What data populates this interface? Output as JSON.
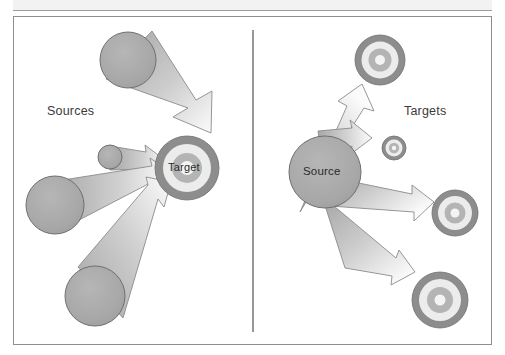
{
  "figure": {
    "title_band": "",
    "divider": {
      "name": "vertical-divider",
      "x": 253,
      "y1": 30,
      "y2": 332
    },
    "left_panel": {
      "caption": "Sources",
      "hub_label": "Target",
      "description": "many-to-one: several source shapes converge with arrows onto a single bullseye target",
      "sources": [
        {
          "id": "source-top-left",
          "cx": 128,
          "cy": 60,
          "r": 28
        },
        {
          "id": "source-mid-small",
          "cx": 110,
          "cy": 157,
          "r": 12
        },
        {
          "id": "source-mid-left",
          "cx": 55,
          "cy": 205,
          "r": 29
        },
        {
          "id": "source-bottom-left",
          "cx": 95,
          "cy": 296,
          "r": 30
        }
      ],
      "hub": {
        "id": "target-hub",
        "cx": 187,
        "cy": 168,
        "r": 32
      }
    },
    "right_panel": {
      "caption": "Targets",
      "hub_label": "Source",
      "description": "one-to-many: a single source circle fans out with arrows to several bullseye targets",
      "hub": {
        "id": "source-hub",
        "cx": 325,
        "cy": 172,
        "r": 36
      },
      "targets": [
        {
          "id": "target-top-right",
          "cx": 380,
          "cy": 60,
          "r": 25
        },
        {
          "id": "target-small-right",
          "cx": 394,
          "cy": 148,
          "r": 12
        },
        {
          "id": "target-mid-right",
          "cx": 455,
          "cy": 213,
          "r": 23
        },
        {
          "id": "target-bottom-right",
          "cx": 440,
          "cy": 300,
          "r": 28
        }
      ]
    }
  },
  "colors": {
    "shape_fill": "#a8a8a8",
    "shape_stroke": "#6f6f6f",
    "arrow_light": "#fbfbfb",
    "arrow_dark": "#a0a0a0",
    "ring_dark": "#8d8d8d",
    "ring_light": "#ececec",
    "ring_mid": "#b4b4b4",
    "ring_core": "#f4f4f4",
    "frame_border": "#8e8e8e",
    "band_fill": "#f2f2f2",
    "text": "#3a3a3a",
    "page_background": "#ffffff"
  }
}
